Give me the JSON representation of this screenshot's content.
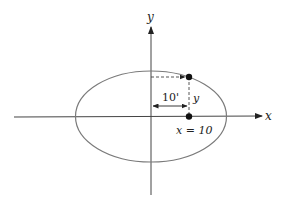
{
  "diagram": {
    "axes": {
      "x_label": "x",
      "y_label": "y"
    },
    "ellipse": {
      "description": "ellipse centered at origin, wider than tall"
    },
    "labels": {
      "horizontal_distance": "10'",
      "vertical_distance": "y",
      "point_label": "x = 10"
    },
    "colors": {
      "axis": "#333333",
      "ellipse": "#7a7a7a",
      "dashed": "#444444",
      "point": "#111111"
    }
  }
}
